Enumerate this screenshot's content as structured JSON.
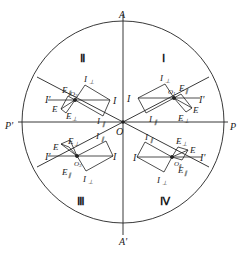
{
  "figure": {
    "type": "polarization-diagram",
    "colors": {
      "line": "#222222",
      "background": "#ffffff"
    },
    "axes": {
      "top": "A",
      "bottom": "A'",
      "left": "P'",
      "right": "P"
    },
    "center_label": "O",
    "quadrants": [
      {
        "numeral": "Ⅰ",
        "labels": {
          "I": "I",
          "I_prime": "I'",
          "I_perp": "I",
          "I_perp_sub": "⊥",
          "I_par": "I",
          "I_par_sub": "∥",
          "E": "E",
          "E_perp": "E",
          "E_perp_sub": "⊥",
          "E_par": "E",
          "E_par_sub": "∥",
          "origin": "O",
          "origin_sub": "1"
        }
      },
      {
        "numeral": "Ⅱ",
        "labels": {
          "I": "I",
          "I_prime": "I'",
          "I_perp": "I",
          "I_perp_sub": "⊥",
          "I_par": "I",
          "I_par_sub": "∥",
          "E": "E",
          "E_perp": "E",
          "E_perp_sub": "⊥",
          "E_par": "E",
          "E_par_sub": "∥",
          "origin": "O",
          "origin_sub": "2"
        }
      },
      {
        "numeral": "Ⅲ",
        "labels": {
          "I": "I",
          "I_prime": "I'",
          "I_perp": "I",
          "I_perp_sub": "⊥",
          "I_par": "I",
          "I_par_sub": "∥",
          "E": "E",
          "E_perp": "E",
          "E_perp_sub": "⊥",
          "E_par": "E",
          "E_par_sub": "∥",
          "origin": "O",
          "origin_sub": "3"
        }
      },
      {
        "numeral": "Ⅳ",
        "labels": {
          "I": "I",
          "I_prime": "I'",
          "I_perp": "I",
          "I_perp_sub": "⊥",
          "I_par": "I",
          "I_par_sub": "∥",
          "E": "E",
          "E_perp": "E",
          "E_perp_sub": "⊥",
          "E_par": "E",
          "E_par_sub": "∥",
          "origin": "O",
          "origin_sub": "4"
        }
      }
    ]
  }
}
